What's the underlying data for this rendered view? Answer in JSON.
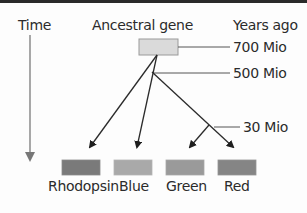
{
  "diagram": {
    "time_label": "Time",
    "root_label": "Ancestral gene",
    "years_header": "Years ago",
    "time_marks": [
      {
        "label": "700 Mio",
        "event": "ancestral gene"
      },
      {
        "label": "500 Mio",
        "event": "split into rhodopsin/blue and green-red lineage"
      },
      {
        "label": "30 Mio",
        "event": "green/red split"
      }
    ],
    "leaves": [
      {
        "label": "Rhodopsin",
        "color": "#7a7a7a"
      },
      {
        "label": "Blue",
        "color": "#a9a9a9"
      },
      {
        "label": "Green",
        "color": "#9a9a9a"
      },
      {
        "label": "Red",
        "color": "#858585"
      }
    ],
    "root_box_color": "#dadada",
    "line_color": "#2b2b2b",
    "time_arrow_color": "#777777"
  }
}
